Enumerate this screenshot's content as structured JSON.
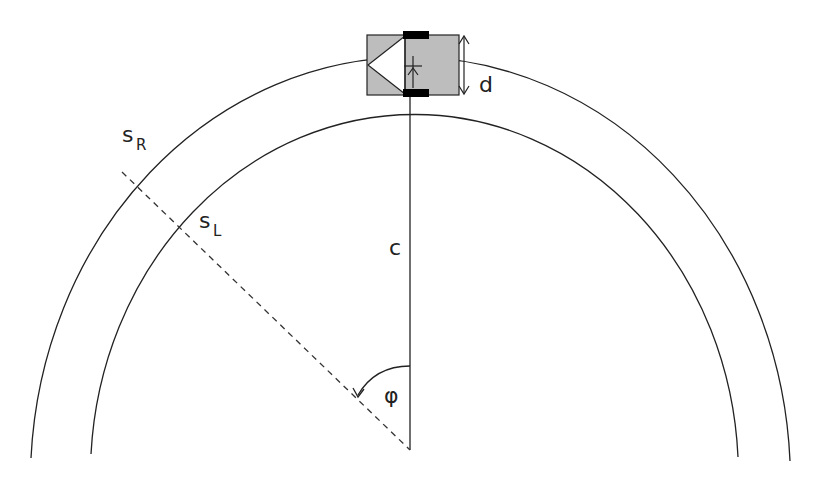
{
  "diagram": {
    "type": "differential-drive robot on curved track",
    "labels": {
      "s_main": "s",
      "s_right_sub": "R",
      "s_left_sub": "L",
      "distance": "d",
      "radius": "c",
      "angle": "φ"
    },
    "colors": {
      "line": "#222222",
      "robot_body": "#bdbdbd",
      "wheel": "#000000",
      "background": "#ffffff"
    }
  }
}
